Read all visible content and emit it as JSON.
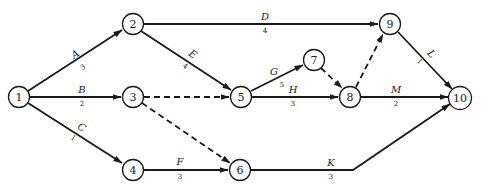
{
  "diagram": {
    "type": "activity-on-arrow network",
    "nodes": [
      {
        "id": "1",
        "label": "1",
        "x": 19,
        "y": 97
      },
      {
        "id": "2",
        "label": "2",
        "x": 133,
        "y": 24
      },
      {
        "id": "3",
        "label": "3",
        "x": 133,
        "y": 97
      },
      {
        "id": "4",
        "label": "4",
        "x": 133,
        "y": 170
      },
      {
        "id": "5",
        "label": "5",
        "x": 241,
        "y": 97
      },
      {
        "id": "6",
        "label": "6",
        "x": 240,
        "y": 170
      },
      {
        "id": "7",
        "label": "7",
        "x": 314,
        "y": 60
      },
      {
        "id": "8",
        "label": "8",
        "x": 350,
        "y": 97
      },
      {
        "id": "9",
        "label": "9",
        "x": 390,
        "y": 24
      },
      {
        "id": "10",
        "label": "10",
        "x": 460,
        "y": 98
      }
    ],
    "edges": [
      {
        "from": "1",
        "to": "2",
        "name": "A",
        "duration": "3",
        "dashed": false
      },
      {
        "from": "1",
        "to": "3",
        "name": "B",
        "duration": "2",
        "dashed": false
      },
      {
        "from": "1",
        "to": "4",
        "name": "C",
        "duration": "1",
        "dashed": false
      },
      {
        "from": "2",
        "to": "9",
        "name": "D",
        "duration": "4",
        "dashed": false
      },
      {
        "from": "2",
        "to": "5",
        "name": "E",
        "duration": "4",
        "dashed": false
      },
      {
        "from": "3",
        "to": "5",
        "name": "",
        "duration": "",
        "dashed": true
      },
      {
        "from": "3",
        "to": "6",
        "name": "",
        "duration": "",
        "dashed": true
      },
      {
        "from": "4",
        "to": "6",
        "name": "F",
        "duration": "3",
        "dashed": false
      },
      {
        "from": "5",
        "to": "7",
        "name": "G",
        "duration": "5",
        "dashed": false
      },
      {
        "from": "5",
        "to": "8",
        "name": "H",
        "duration": "3",
        "dashed": false
      },
      {
        "from": "7",
        "to": "8",
        "name": "",
        "duration": "",
        "dashed": true
      },
      {
        "from": "8",
        "to": "9",
        "name": "",
        "duration": "",
        "dashed": true
      },
      {
        "from": "6",
        "to": "10",
        "name": "K",
        "duration": "3",
        "dashed": false
      },
      {
        "from": "9",
        "to": "10",
        "name": "L",
        "duration": "1",
        "dashed": false
      },
      {
        "from": "8",
        "to": "10",
        "name": "M",
        "duration": "2",
        "dashed": false
      }
    ]
  },
  "labels": {
    "n1": "1",
    "n2": "2",
    "n3": "3",
    "n4": "4",
    "n5": "5",
    "n6": "6",
    "n7": "7",
    "n8": "8",
    "n9": "9",
    "n10": "10",
    "A": "A",
    "A_dur": "3",
    "B": "B",
    "B_dur": "2",
    "C": "C",
    "C_dur": "1",
    "D": "D",
    "D_dur": "4",
    "E": "E",
    "E_dur": "4",
    "F": "F",
    "F_dur": "3",
    "G": "G",
    "G_dur": "5",
    "H": "H",
    "H_dur": "3",
    "K": "K",
    "K_dur": "3",
    "L": "L",
    "L_dur": "1",
    "M": "M",
    "M_dur": "2"
  }
}
